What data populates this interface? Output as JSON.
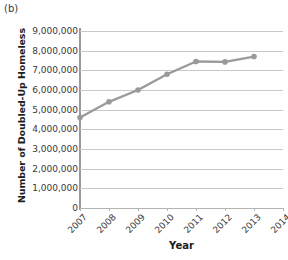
{
  "panel": {
    "label": "(b)"
  },
  "chart_data": {
    "type": "line",
    "title": "",
    "xlabel": "Year",
    "ylabel": "Number of Doubled-Up Homeless",
    "x": [
      2007,
      2008,
      2009,
      2010,
      2011,
      2012,
      2013
    ],
    "values": [
      4600000,
      5400000,
      6000000,
      6800000,
      7450000,
      7430000,
      7700000
    ],
    "series": [
      {
        "name": "Number of Doubled-Up Homeless",
        "values": [
          4600000,
          5400000,
          6000000,
          6800000,
          7450000,
          7430000,
          7700000
        ]
      }
    ],
    "xticklabels": [
      "2007",
      "2008",
      "2009",
      "2010",
      "2011",
      "2012",
      "2013",
      "2014"
    ],
    "xlim": [
      2007,
      2014
    ],
    "ylim": [
      0,
      9000000
    ],
    "yticks": [
      0,
      1000000,
      2000000,
      3000000,
      4000000,
      5000000,
      6000000,
      7000000,
      8000000,
      9000000
    ],
    "yticklabels": [
      "0",
      "1,000,000",
      "2,000,000",
      "3,000,000",
      "4,000,000",
      "5,000,000",
      "6,000,000",
      "7,000,000",
      "8,000,000",
      "9,000,000"
    ],
    "grid": "horizontal",
    "legend": "none",
    "line_color": "#9a9a9a",
    "marker_color": "#9a9a9a",
    "gridline_color": "#c9c9c9",
    "axis_color": "#9a9a9a"
  }
}
